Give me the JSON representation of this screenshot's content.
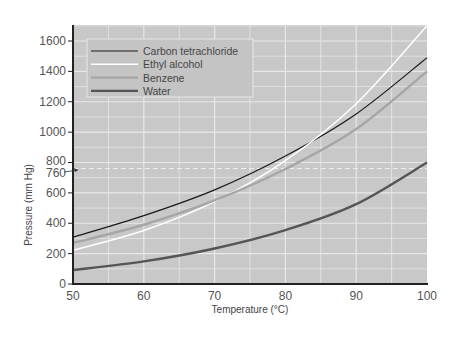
{
  "chart_data": {
    "type": "line",
    "title": "",
    "xlabel": "Temperature (°C)",
    "ylabel": "Pressure (mm Hg)",
    "xlim": [
      50,
      100
    ],
    "ylim": [
      0,
      1700
    ],
    "x_ticks": [
      50,
      60,
      70,
      80,
      90,
      100
    ],
    "y_ticks": [
      0,
      200,
      400,
      600,
      760,
      800,
      1000,
      1200,
      1400,
      1600
    ],
    "grid": true,
    "legend_position": "upper left",
    "annotations": [
      {
        "text": "760",
        "type": "dashed reference line",
        "y": 760
      }
    ],
    "x": [
      50,
      60,
      70,
      80,
      90,
      100
    ],
    "series": [
      {
        "name": "Carbon tetrachloride",
        "color": "#1a1a1a",
        "values": [
          308,
          450,
          620,
          843,
          1120,
          1490
        ]
      },
      {
        "name": "Ethyl alcohol",
        "color": "#ffffff",
        "values": [
          222,
          352,
          542,
          812,
          1187,
          1700
        ]
      },
      {
        "name": "Benzene",
        "color": "#a6a6a6",
        "values": [
          270,
          390,
          550,
          757,
          1020,
          1400
        ]
      },
      {
        "name": "Water",
        "color": "#555555",
        "values": [
          92,
          149,
          234,
          355,
          526,
          800
        ]
      }
    ]
  },
  "colors": {
    "plot_bg": "#c8c8c8",
    "grid": "#e6e6e6",
    "axis": "#222222"
  }
}
